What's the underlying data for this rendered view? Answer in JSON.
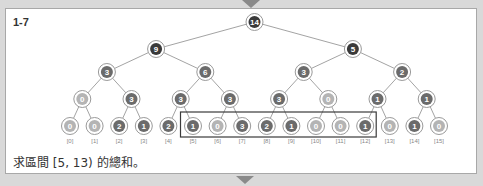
{
  "figure": {
    "label": "1-7",
    "caption": "求區間 [5, 13) 的總和。",
    "colors": {
      "dark": "#3a3a3a",
      "mid": "#6b6b6b",
      "light": "#b4b4b4",
      "edge": "#8c8c8c",
      "highlight_box": "#3a3a3a"
    }
  },
  "tree": {
    "levels": [
      [
        14
      ],
      [
        9,
        5
      ],
      [
        3,
        6,
        3,
        2
      ],
      [
        0,
        3,
        3,
        3,
        3,
        0,
        1,
        1
      ],
      [
        0,
        0,
        2,
        1,
        2,
        1,
        0,
        3,
        2,
        1,
        0,
        0,
        1,
        0,
        1,
        0
      ]
    ],
    "leaf_indices": [
      "[0]",
      "[1]",
      "[2]",
      "[3]",
      "[4]",
      "[5]",
      "[6]",
      "[7]",
      "[8]",
      "[9]",
      "[10]",
      "[11]",
      "[12]",
      "[13]",
      "[14]",
      "[15]"
    ],
    "highlight_range": {
      "start": 5,
      "end": 13
    }
  }
}
